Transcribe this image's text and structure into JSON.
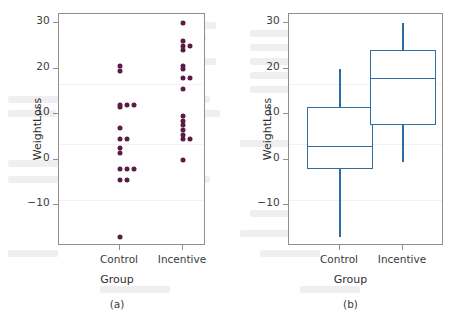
{
  "figure": {
    "axis_label_y": "WeightLoss",
    "axis_label_x": "Group",
    "categories": [
      "Control",
      "Incentive"
    ],
    "y_ticks": [
      "30",
      "20",
      "10",
      "0",
      "−10"
    ],
    "caption_a": "(a)",
    "caption_b": "(b)",
    "colors": {
      "dot": "#5a1b45",
      "box_line": "#2f6ea5",
      "frame": "#8f8f8f",
      "text": "#3b3b3b",
      "background": "#ffffff"
    }
  },
  "chart_data": [
    {
      "type": "scatter",
      "panel": "(a)",
      "title": "",
      "xlabel": "Group",
      "ylabel": "WeightLoss",
      "categories": [
        "Control",
        "Incentive"
      ],
      "ylim": [
        -19,
        32
      ],
      "yticks": [
        30,
        20,
        10,
        0,
        -10
      ],
      "grid": false,
      "legend": "none",
      "series": [
        {
          "name": "Control",
          "values": [
            -17,
            -4.5,
            -4.5,
            -2,
            -2,
            -2,
            1.5,
            2.5,
            4.5,
            4.5,
            7,
            11.5,
            12,
            12,
            12,
            19.5,
            20.5
          ]
        },
        {
          "name": "Incentive",
          "values": [
            0,
            4.5,
            4.5,
            5.5,
            6.5,
            7.5,
            8.5,
            9.5,
            15.5,
            18,
            18,
            20,
            20.5,
            24,
            25,
            25,
            26,
            30
          ]
        }
      ]
    },
    {
      "type": "boxplot",
      "panel": "(b)",
      "title": "",
      "xlabel": "Group",
      "ylabel": "WeightLoss",
      "categories": [
        "Control",
        "Incentive"
      ],
      "ylim": [
        -19,
        32
      ],
      "yticks": [
        30,
        20,
        10,
        0,
        -10
      ],
      "grid": false,
      "legend": "none",
      "boxes": [
        {
          "name": "Control",
          "min": -17,
          "q1": -2,
          "median": 3,
          "q3": 11.5,
          "max": 20
        },
        {
          "name": "Incentive",
          "min": -0.5,
          "q1": 7.5,
          "median": 18,
          "q3": 24,
          "max": 30
        }
      ]
    }
  ]
}
